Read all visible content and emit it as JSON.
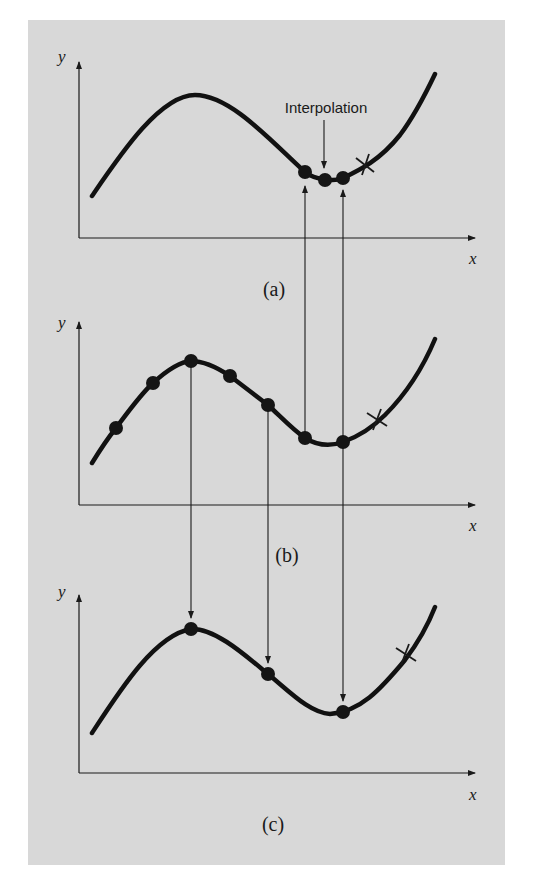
{
  "figure": {
    "background": "#d8d8d8",
    "panels": [
      {
        "id": "a",
        "caption": "(a)",
        "x_label": "x",
        "y_label": "y",
        "annotation": "Interpolation",
        "description": "Coarse view: three data points near the local minimum with an interpolated point between them"
      },
      {
        "id": "b",
        "caption": "(b)",
        "x_label": "x",
        "y_label": "y",
        "description": "Seven data points along the curve"
      },
      {
        "id": "c",
        "caption": "(c)",
        "x_label": "x",
        "y_label": "y",
        "description": "Three data points selected from (b) at the maximum, the middle, and the minimum"
      }
    ],
    "points": {
      "a": [
        [
          305,
          172
        ],
        [
          325,
          180
        ],
        [
          343,
          178
        ]
      ],
      "b": [
        [
          116,
          428
        ],
        [
          153,
          383
        ],
        [
          191,
          361
        ],
        [
          230,
          376
        ],
        [
          268,
          405
        ],
        [
          305,
          438
        ],
        [
          343,
          442
        ]
      ],
      "c": [
        [
          191,
          629
        ],
        [
          268,
          674
        ],
        [
          343,
          712
        ]
      ]
    },
    "x_marks": {
      "a": [
        365,
        165
      ],
      "b": [
        377,
        420
      ],
      "c": [
        405,
        655
      ]
    }
  }
}
